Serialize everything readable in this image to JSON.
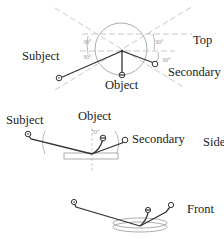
{
  "figure": {
    "views": {
      "top": {
        "label": "Top",
        "angles": [
          "30°",
          "30°",
          "30°",
          "30°"
        ],
        "nodes": {
          "subject": "Subject",
          "object": "Object",
          "secondary": "Secondary"
        }
      },
      "side": {
        "label": "Side",
        "angle": "70°",
        "nodes": {
          "subject": "Subject",
          "object": "Object",
          "secondary": "Secondary"
        }
      },
      "front": {
        "label": "Front"
      }
    }
  }
}
